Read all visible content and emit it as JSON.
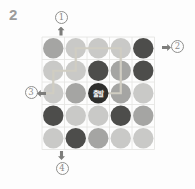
{
  "page": {
    "problem_number": "2"
  },
  "diagram": {
    "grid": {
      "left": 42,
      "top": 37,
      "cell": 22.5,
      "rows": 5,
      "cols": 5,
      "line_color": "#e5e5e3",
      "dot_radius": 10.2,
      "cells": [
        [
          "medium",
          "light",
          "light",
          "light",
          "dark"
        ],
        [
          "light",
          "light",
          "dark",
          "medium",
          "dark"
        ],
        [
          "light",
          "medium",
          "start",
          "medium",
          "light"
        ],
        [
          "dark",
          "light",
          "light",
          "dark",
          "medium"
        ],
        [
          "light",
          "dark",
          "medium",
          "light",
          "light"
        ]
      ],
      "colors": {
        "light": "#c9c9c7",
        "medium": "#a5a5a3",
        "dark": "#4d4d4b",
        "start": "#2f2f2d"
      }
    },
    "start_label": "출발",
    "start_label_color": "#ffffff",
    "path": {
      "color": "#d0cdc2",
      "width": 2.2,
      "points": [
        [
          39,
          93.25
        ],
        [
          53.25,
          93.25
        ],
        [
          53.25,
          70.75
        ],
        [
          75.75,
          70.75
        ],
        [
          75.75,
          48.25
        ],
        [
          120.75,
          48.25
        ],
        [
          120.75,
          93.25
        ],
        [
          107,
          93.25
        ]
      ]
    },
    "exits": [
      {
        "num": "1",
        "side": "top"
      },
      {
        "num": "2",
        "side": "right"
      },
      {
        "num": "3",
        "side": "left"
      },
      {
        "num": "4",
        "side": "bottom"
      }
    ]
  }
}
